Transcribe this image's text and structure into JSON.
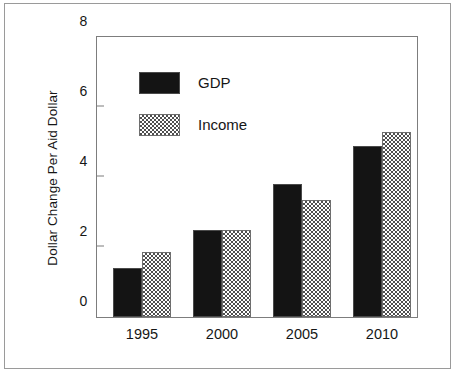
{
  "chart_data": {
    "type": "bar",
    "title": "",
    "xlabel": "",
    "ylabel": "Dollar Change Per Aid Dollar",
    "categories": [
      "1995",
      "2000",
      "2005",
      "2010"
    ],
    "series": [
      {
        "name": "GDP",
        "values": [
          1.4,
          2.5,
          3.8,
          4.9
        ],
        "color": "#141414",
        "fill": "solid-black"
      },
      {
        "name": "Income",
        "values": [
          1.85,
          2.5,
          3.35,
          5.3
        ],
        "color": "#4f4f4f",
        "fill": "checkerboard"
      }
    ],
    "ylim": [
      0,
      8
    ],
    "yticks": [
      0,
      2,
      4,
      6,
      8
    ],
    "ytick_labels": [
      "0",
      "2",
      "4",
      "6",
      "8"
    ],
    "grid": false,
    "legend_position": "upper-left-inside",
    "legend_entries": [
      "GDP",
      "Income"
    ]
  },
  "figure": {
    "y_axis_title": "Dollar Change Per Aid Dollar"
  }
}
